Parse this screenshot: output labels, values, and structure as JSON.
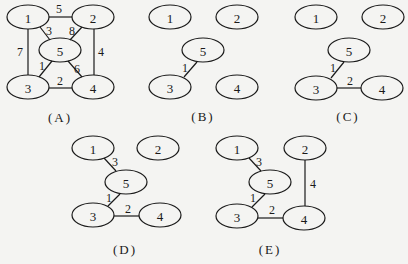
{
  "colors": {
    "stroke": "#1a1a1a",
    "background": "#f4f4f2"
  },
  "node_radius": {
    "rx": 21,
    "ry": 12
  },
  "panels": [
    {
      "id": "A",
      "label": "(A)",
      "label_pos": [
        60,
        117
      ],
      "nodes": [
        {
          "id": "1",
          "label": "1",
          "x": 28,
          "y": 17
        },
        {
          "id": "2",
          "label": "2",
          "x": 93,
          "y": 17
        },
        {
          "id": "5",
          "label": "5",
          "x": 60,
          "y": 50
        },
        {
          "id": "3",
          "label": "3",
          "x": 28,
          "y": 87
        },
        {
          "id": "4",
          "label": "4",
          "x": 93,
          "y": 87
        }
      ],
      "edges": [
        {
          "from": "1",
          "to": "2",
          "weight": "5",
          "x1": 49,
          "y1": 17,
          "x2": 72,
          "y2": 17,
          "lx": 59,
          "ly": 9
        },
        {
          "from": "1",
          "to": "5",
          "weight": "3",
          "x1": 40,
          "y1": 27,
          "x2": 50,
          "y2": 40,
          "lx": 49,
          "ly": 31
        },
        {
          "from": "2",
          "to": "5",
          "weight": "8",
          "x1": 82,
          "y1": 27,
          "x2": 70,
          "y2": 40,
          "lx": 72,
          "ly": 31
        },
        {
          "from": "1",
          "to": "3",
          "weight": "7",
          "x1": 28,
          "y1": 29,
          "x2": 28,
          "y2": 75,
          "lx": 20,
          "ly": 52
        },
        {
          "from": "2",
          "to": "4",
          "weight": "4",
          "x1": 94,
          "y1": 29,
          "x2": 94,
          "y2": 75,
          "lx": 101,
          "ly": 52
        },
        {
          "from": "5",
          "to": "3",
          "weight": "1",
          "x1": 52,
          "y1": 61,
          "x2": 39,
          "y2": 77,
          "lx": 42,
          "ly": 66
        },
        {
          "from": "5",
          "to": "4",
          "weight": "6",
          "x1": 68,
          "y1": 61,
          "x2": 82,
          "y2": 77,
          "lx": 77,
          "ly": 69
        },
        {
          "from": "3",
          "to": "4",
          "weight": "2",
          "x1": 49,
          "y1": 88,
          "x2": 72,
          "y2": 88,
          "lx": 60,
          "ly": 81
        }
      ]
    },
    {
      "id": "B",
      "label": "(B)",
      "label_pos": [
        203,
        116
      ],
      "nodes": [
        {
          "id": "1",
          "label": "1",
          "x": 170,
          "y": 17
        },
        {
          "id": "2",
          "label": "2",
          "x": 237,
          "y": 17
        },
        {
          "id": "5",
          "label": "5",
          "x": 203,
          "y": 50
        },
        {
          "id": "3",
          "label": "3",
          "x": 170,
          "y": 87
        },
        {
          "id": "4",
          "label": "4",
          "x": 237,
          "y": 87
        }
      ],
      "edges": [
        {
          "from": "5",
          "to": "3",
          "weight": "1",
          "x1": 197,
          "y1": 62,
          "x2": 184,
          "y2": 77,
          "lx": 185,
          "ly": 68
        }
      ]
    },
    {
      "id": "C",
      "label": "(C)",
      "label_pos": [
        348,
        116
      ],
      "nodes": [
        {
          "id": "1",
          "label": "1",
          "x": 316,
          "y": 17
        },
        {
          "id": "2",
          "label": "2",
          "x": 383,
          "y": 17
        },
        {
          "id": "5",
          "label": "5",
          "x": 349,
          "y": 50
        },
        {
          "id": "3",
          "label": "3",
          "x": 316,
          "y": 88
        },
        {
          "id": "4",
          "label": "4",
          "x": 382,
          "y": 88
        }
      ],
      "edges": [
        {
          "from": "5",
          "to": "3",
          "weight": "1",
          "x1": 344,
          "y1": 62,
          "x2": 331,
          "y2": 78,
          "lx": 333,
          "ly": 68
        },
        {
          "from": "3",
          "to": "4",
          "weight": "2",
          "x1": 337,
          "y1": 88,
          "x2": 361,
          "y2": 88,
          "lx": 350,
          "ly": 81
        }
      ]
    },
    {
      "id": "D",
      "label": "(D)",
      "label_pos": [
        125,
        249
      ],
      "nodes": [
        {
          "id": "1",
          "label": "1",
          "x": 93,
          "y": 148
        },
        {
          "id": "2",
          "label": "2",
          "x": 158,
          "y": 148
        },
        {
          "id": "5",
          "label": "5",
          "x": 126,
          "y": 182
        },
        {
          "id": "3",
          "label": "3",
          "x": 93,
          "y": 215
        },
        {
          "id": "4",
          "label": "4",
          "x": 160,
          "y": 215
        }
      ],
      "edges": [
        {
          "from": "1",
          "to": "5",
          "weight": "3",
          "x1": 104,
          "y1": 158,
          "x2": 116,
          "y2": 171,
          "lx": 115,
          "ly": 162
        },
        {
          "from": "5",
          "to": "3",
          "weight": "1",
          "x1": 120,
          "y1": 194,
          "x2": 108,
          "y2": 206,
          "lx": 109,
          "ly": 198
        },
        {
          "from": "3",
          "to": "4",
          "weight": "2",
          "x1": 114,
          "y1": 216,
          "x2": 139,
          "y2": 216,
          "lx": 128,
          "ly": 209
        }
      ]
    },
    {
      "id": "E",
      "label": "(E)",
      "label_pos": [
        270,
        249
      ],
      "nodes": [
        {
          "id": "1",
          "label": "1",
          "x": 237,
          "y": 148
        },
        {
          "id": "2",
          "label": "2",
          "x": 305,
          "y": 148
        },
        {
          "id": "5",
          "label": "5",
          "x": 270,
          "y": 182
        },
        {
          "id": "3",
          "label": "3",
          "x": 237,
          "y": 216
        },
        {
          "id": "4",
          "label": "4",
          "x": 304,
          "y": 218
        }
      ],
      "edges": [
        {
          "from": "1",
          "to": "5",
          "weight": "3",
          "x1": 249,
          "y1": 158,
          "x2": 261,
          "y2": 171,
          "lx": 259,
          "ly": 162
        },
        {
          "from": "2",
          "to": "4",
          "weight": "4",
          "x1": 305,
          "y1": 160,
          "x2": 305,
          "y2": 206,
          "lx": 313,
          "ly": 184
        },
        {
          "from": "5",
          "to": "3",
          "weight": "1",
          "x1": 265,
          "y1": 194,
          "x2": 252,
          "y2": 207,
          "lx": 253,
          "ly": 198
        },
        {
          "from": "3",
          "to": "4",
          "weight": "2",
          "x1": 258,
          "y1": 218,
          "x2": 283,
          "y2": 218,
          "lx": 272,
          "ly": 210
        }
      ]
    }
  ]
}
